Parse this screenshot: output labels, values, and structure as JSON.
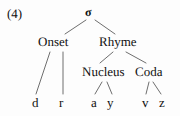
{
  "figure": {
    "example_number": "(4)",
    "type": "syllable-structure-tree",
    "line_color": "#6e6e6e",
    "text_color": "#111111",
    "background_color": "#fdfdfd"
  },
  "tree": {
    "root": {
      "id": "sigma",
      "label": "σ",
      "name": "sigma-node"
    },
    "nodes": [
      {
        "id": "sigma",
        "label": "σ",
        "level": 0,
        "x": 90,
        "y": 12
      },
      {
        "id": "onset",
        "label": "Onset",
        "level": 1,
        "x": 57,
        "y": 42
      },
      {
        "id": "rhyme",
        "label": "Rhyme",
        "level": 1,
        "x": 119,
        "y": 42
      },
      {
        "id": "nucleus",
        "label": "Nucleus",
        "level": 2,
        "x": 105,
        "y": 72
      },
      {
        "id": "coda",
        "label": "Coda",
        "level": 2,
        "x": 151,
        "y": 72
      },
      {
        "id": "seg-d",
        "label": "d",
        "level": 3,
        "x": 35,
        "y": 103
      },
      {
        "id": "seg-r",
        "label": "r",
        "level": 3,
        "x": 62,
        "y": 103
      },
      {
        "id": "seg-a",
        "label": "a",
        "level": 3,
        "x": 94,
        "y": 103
      },
      {
        "id": "seg-y",
        "label": "y",
        "level": 3,
        "x": 110,
        "y": 103
      },
      {
        "id": "seg-v",
        "label": "v",
        "level": 3,
        "x": 145,
        "y": 103
      },
      {
        "id": "seg-z",
        "label": "z",
        "level": 3,
        "x": 162,
        "y": 103
      }
    ],
    "edges": [
      {
        "from": "sigma",
        "to": "onset",
        "x1": 86,
        "y1": 20,
        "x2": 65,
        "y2": 34
      },
      {
        "from": "sigma",
        "to": "rhyme",
        "x1": 95,
        "y1": 20,
        "x2": 115,
        "y2": 34
      },
      {
        "from": "onset",
        "to": "seg-d",
        "x1": 50,
        "y1": 52,
        "x2": 36,
        "y2": 94
      },
      {
        "from": "onset",
        "to": "seg-r",
        "x1": 63,
        "y1": 52,
        "x2": 63,
        "y2": 94
      },
      {
        "from": "rhyme",
        "to": "nucleus",
        "x1": 113,
        "y1": 52,
        "x2": 100,
        "y2": 63
      },
      {
        "from": "rhyme",
        "to": "coda",
        "x1": 126,
        "y1": 52,
        "x2": 146,
        "y2": 63
      },
      {
        "from": "nucleus",
        "to": "seg-a",
        "x1": 102,
        "y1": 82,
        "x2": 95,
        "y2": 94
      },
      {
        "from": "nucleus",
        "to": "seg-y",
        "x1": 107,
        "y1": 82,
        "x2": 112,
        "y2": 94
      },
      {
        "from": "coda",
        "to": "seg-v",
        "x1": 149,
        "y1": 82,
        "x2": 146,
        "y2": 94
      },
      {
        "from": "coda",
        "to": "seg-z",
        "x1": 153,
        "y1": 82,
        "x2": 161,
        "y2": 94
      }
    ]
  },
  "labels": {
    "example_number": "(4)",
    "sigma": "σ",
    "onset": "Onset",
    "rhyme": "Rhyme",
    "nucleus": "Nucleus",
    "coda": "Coda",
    "seg_d": "d",
    "seg_r": "r",
    "seg_a": "a",
    "seg_y": "y",
    "seg_v": "v",
    "seg_z": "z"
  }
}
